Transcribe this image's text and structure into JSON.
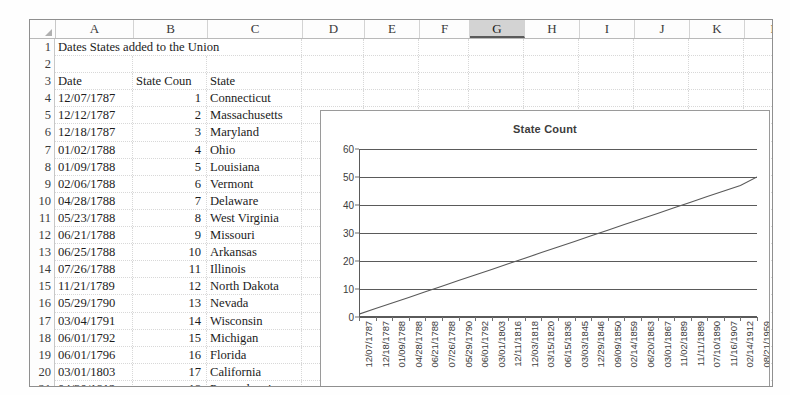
{
  "app": {
    "type": "spreadsheet"
  },
  "sheet": {
    "columns": [
      "A",
      "B",
      "C",
      "D",
      "E",
      "F",
      "G",
      "H",
      "I",
      "J",
      "K",
      "L"
    ],
    "selected_column": "G",
    "corner_icon": "select-all-triangle-icon",
    "row_numbers": [
      "1",
      "2",
      "3",
      "4",
      "5",
      "6",
      "7",
      "8",
      "9",
      "10",
      "11",
      "12",
      "13",
      "14",
      "15",
      "16",
      "17",
      "18",
      "19",
      "20",
      "21"
    ],
    "title_cell": "Dates States added to the Union",
    "headers": {
      "a": "Date",
      "b": "State Coun",
      "c": "State"
    },
    "rows": [
      {
        "n": "4",
        "date": "12/07/1787",
        "count": "1",
        "state": "Connecticut"
      },
      {
        "n": "5",
        "date": "12/12/1787",
        "count": "2",
        "state": "Massachusetts"
      },
      {
        "n": "6",
        "date": "12/18/1787",
        "count": "3",
        "state": "Maryland"
      },
      {
        "n": "7",
        "date": "01/02/1788",
        "count": "4",
        "state": "Ohio"
      },
      {
        "n": "8",
        "date": "01/09/1788",
        "count": "5",
        "state": "Louisiana"
      },
      {
        "n": "9",
        "date": "02/06/1788",
        "count": "6",
        "state": "Vermont"
      },
      {
        "n": "10",
        "date": "04/28/1788",
        "count": "7",
        "state": "Delaware"
      },
      {
        "n": "11",
        "date": "05/23/1788",
        "count": "8",
        "state": "West Virginia"
      },
      {
        "n": "12",
        "date": "06/21/1788",
        "count": "9",
        "state": "Missouri"
      },
      {
        "n": "13",
        "date": "06/25/1788",
        "count": "10",
        "state": "Arkansas"
      },
      {
        "n": "14",
        "date": "07/26/1788",
        "count": "11",
        "state": "Illinois"
      },
      {
        "n": "15",
        "date": "11/21/1789",
        "count": "12",
        "state": "North Dakota"
      },
      {
        "n": "16",
        "date": "05/29/1790",
        "count": "13",
        "state": "Nevada"
      },
      {
        "n": "17",
        "date": "03/04/1791",
        "count": "14",
        "state": "Wisconsin"
      },
      {
        "n": "18",
        "date": "06/01/1792",
        "count": "15",
        "state": "Michigan"
      },
      {
        "n": "19",
        "date": "06/01/1796",
        "count": "16",
        "state": "Florida"
      },
      {
        "n": "20",
        "date": "03/01/1803",
        "count": "17",
        "state": "California"
      },
      {
        "n": "21",
        "date": "04/30/1812",
        "count": "18",
        "state": "Pennsylvania"
      }
    ]
  },
  "chart_data": {
    "type": "line",
    "title": "State Count",
    "xlabel": "",
    "ylabel": "",
    "ylim": [
      0,
      60
    ],
    "yticks": [
      0,
      10,
      20,
      30,
      40,
      50,
      60
    ],
    "grid": true,
    "legend": "none",
    "line_color": "#595959",
    "categories": [
      "12/07/1787",
      "12/18/1787",
      "01/09/1788",
      "04/28/1788",
      "06/21/1788",
      "07/26/1788",
      "05/29/1790",
      "06/01/1792",
      "03/01/1803",
      "12/11/1816",
      "12/03/1818",
      "03/15/1820",
      "06/15/1836",
      "03/03/1845",
      "12/29/1846",
      "09/09/1850",
      "02/14/1859",
      "06/20/1863",
      "03/01/1867",
      "11/02/1889",
      "11/11/1889",
      "07/10/1890",
      "11/16/1907",
      "02/14/1912",
      "08/21/1959"
    ],
    "values": [
      1,
      3,
      5,
      7,
      9,
      11,
      13,
      15,
      17,
      19,
      21,
      23,
      25,
      27,
      29,
      31,
      33,
      35,
      37,
      39,
      41,
      43,
      45,
      47,
      50
    ],
    "series": [
      {
        "name": "State Count",
        "values": [
          1,
          3,
          5,
          7,
          9,
          11,
          13,
          15,
          17,
          19,
          21,
          23,
          25,
          27,
          29,
          31,
          33,
          35,
          37,
          39,
          41,
          43,
          45,
          47,
          50
        ]
      }
    ]
  }
}
